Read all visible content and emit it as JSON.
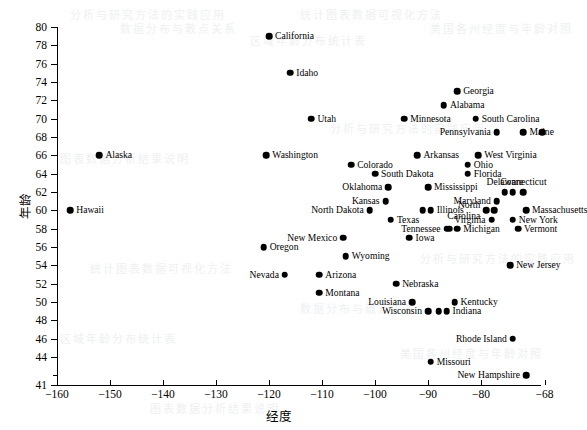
{
  "chart_data": {
    "type": "scatter",
    "title": "",
    "xlabel": "经度",
    "ylabel": "年龄",
    "xlim": [
      -162,
      -66
    ],
    "ylim": [
      41,
      80
    ],
    "xticks": [
      -160,
      -150,
      -140,
      -130,
      -120,
      -110,
      -100,
      -90,
      -80,
      -68
    ],
    "yticks": [
      41,
      44,
      46,
      48,
      50,
      52,
      54,
      56,
      58,
      60,
      62,
      64,
      66,
      68,
      70,
      72,
      74,
      76,
      78,
      80
    ],
    "grid": false,
    "legend": null,
    "marker": "filled-circle",
    "marker_color": "#000000",
    "points": [
      {
        "label": "California",
        "x": -120.0,
        "y": 79.0,
        "pos": "right"
      },
      {
        "label": "Idaho",
        "x": -116.0,
        "y": 75.0,
        "pos": "right"
      },
      {
        "label": "Georgia",
        "x": -84.5,
        "y": 73.0,
        "pos": "right"
      },
      {
        "label": "Alabama",
        "x": -87.0,
        "y": 71.5,
        "pos": "right"
      },
      {
        "label": "Utah",
        "x": -112.0,
        "y": 70.0,
        "pos": "right"
      },
      {
        "label": "Minnesota",
        "x": -94.5,
        "y": 70.0,
        "pos": "right"
      },
      {
        "label": "South Carolina",
        "x": -81.0,
        "y": 70.0,
        "pos": "right"
      },
      {
        "label": "Pennsylvania",
        "x": -77.0,
        "y": 68.5,
        "pos": "left"
      },
      {
        "label": "Maine",
        "x": -72.0,
        "y": 68.5,
        "pos": "right"
      },
      {
        "label": "",
        "x": -68.5,
        "y": 68.5,
        "pos": "none"
      },
      {
        "label": "Alaska",
        "x": -152.0,
        "y": 66.0,
        "pos": "right"
      },
      {
        "label": "Washington",
        "x": -120.5,
        "y": 66.0,
        "pos": "right"
      },
      {
        "label": "Arkansas",
        "x": -92.0,
        "y": 66.0,
        "pos": "right"
      },
      {
        "label": "West Virginia",
        "x": -80.5,
        "y": 66.0,
        "pos": "right"
      },
      {
        "label": "Colorado",
        "x": -104.5,
        "y": 65.0,
        "pos": "right"
      },
      {
        "label": "Ohio",
        "x": -82.5,
        "y": 65.0,
        "pos": "right"
      },
      {
        "label": "South Dakota",
        "x": -100.0,
        "y": 64.0,
        "pos": "right"
      },
      {
        "label": "Florida",
        "x": -82.5,
        "y": 64.0,
        "pos": "right"
      },
      {
        "label": "Oklahoma",
        "x": -97.5,
        "y": 62.5,
        "pos": "left"
      },
      {
        "label": "Mississippi",
        "x": -90.0,
        "y": 62.5,
        "pos": "right"
      },
      {
        "label": "Delaware",
        "x": -75.5,
        "y": 62.0,
        "pos": "above"
      },
      {
        "label": "",
        "x": -74.0,
        "y": 62.0,
        "pos": "none"
      },
      {
        "label": "Connecticut",
        "x": -72.0,
        "y": 62.0,
        "pos": "above"
      },
      {
        "label": "Kansas",
        "x": -98.0,
        "y": 61.0,
        "pos": "left"
      },
      {
        "label": "Maryland",
        "x": -77.0,
        "y": 61.0,
        "pos": "left"
      },
      {
        "label": "North Dakota",
        "x": -101.0,
        "y": 60.0,
        "pos": "left"
      },
      {
        "label": "Illinois",
        "x": -89.5,
        "y": 60.0,
        "pos": "right"
      },
      {
        "label": "",
        "x": -91.0,
        "y": 60.0,
        "pos": "none"
      },
      {
        "label": "North Carolina",
        "x": -79.0,
        "y": 60.0,
        "pos": "left-two"
      },
      {
        "label": "",
        "x": -77.5,
        "y": 60.0,
        "pos": "none"
      },
      {
        "label": "Massachusetts",
        "x": -71.5,
        "y": 60.0,
        "pos": "right"
      },
      {
        "label": "Texas",
        "x": -97.0,
        "y": 59.0,
        "pos": "right"
      },
      {
        "label": "Virginia",
        "x": -78.0,
        "y": 59.0,
        "pos": "left"
      },
      {
        "label": "New York",
        "x": -74.0,
        "y": 59.0,
        "pos": "right"
      },
      {
        "label": "Tennessee",
        "x": -86.5,
        "y": 58.0,
        "pos": "left"
      },
      {
        "label": "Michigan",
        "x": -84.5,
        "y": 58.0,
        "pos": "right"
      },
      {
        "label": "",
        "x": -86.0,
        "y": 58.0,
        "pos": "none"
      },
      {
        "label": "Vermont",
        "x": -73.0,
        "y": 58.0,
        "pos": "right"
      },
      {
        "label": "Hawaii",
        "x": -157.5,
        "y": 60.0,
        "pos": "right"
      },
      {
        "label": "New Mexico",
        "x": -106.0,
        "y": 57.0,
        "pos": "left"
      },
      {
        "label": "Iowa",
        "x": -93.5,
        "y": 57.0,
        "pos": "right"
      },
      {
        "label": "Oregon",
        "x": -121.0,
        "y": 56.0,
        "pos": "right"
      },
      {
        "label": "Wyoming",
        "x": -105.5,
        "y": 55.0,
        "pos": "right"
      },
      {
        "label": "New Jersey",
        "x": -74.5,
        "y": 54.0,
        "pos": "right"
      },
      {
        "label": "Nevada",
        "x": -117.0,
        "y": 53.0,
        "pos": "left"
      },
      {
        "label": "Arizona",
        "x": -110.5,
        "y": 53.0,
        "pos": "right"
      },
      {
        "label": "Nebraska",
        "x": -96.0,
        "y": 52.0,
        "pos": "right"
      },
      {
        "label": "Montana",
        "x": -110.5,
        "y": 51.0,
        "pos": "right"
      },
      {
        "label": "Louisiana",
        "x": -93.0,
        "y": 50.0,
        "pos": "left"
      },
      {
        "label": "Kentucky",
        "x": -85.0,
        "y": 50.0,
        "pos": "right"
      },
      {
        "label": "Wisconsin",
        "x": -90.0,
        "y": 49.0,
        "pos": "left"
      },
      {
        "label": "Indiana",
        "x": -86.5,
        "y": 49.0,
        "pos": "right"
      },
      {
        "label": "",
        "x": -88.0,
        "y": 49.0,
        "pos": "none"
      },
      {
        "label": "Rhode Island",
        "x": -74.0,
        "y": 46.0,
        "pos": "left"
      },
      {
        "label": "Missouri",
        "x": -89.5,
        "y": 43.5,
        "pos": "right"
      },
      {
        "label": "New Hampshire",
        "x": -71.5,
        "y": 42.0,
        "pos": "left"
      }
    ]
  },
  "bleed_text": [
    "分析与研究方法的实践应用",
    "统计图表数据可视化方法",
    "数据分布与散点关系",
    "区域年龄分布统计表",
    "美国各州经度与年龄对照",
    "图表数据分析结果说明"
  ]
}
